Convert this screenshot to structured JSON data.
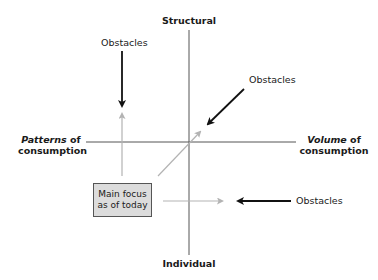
{
  "diagram": {
    "axes": {
      "top": "Structural",
      "bottom": "Individual",
      "left": {
        "italic": "Patterns",
        "rest": " of",
        "line2": "consumption"
      },
      "right": {
        "italic": "Volume",
        "rest": " of",
        "line2": "consumption"
      }
    },
    "focus_box": {
      "line1": "Main focus",
      "line2": "as of today"
    },
    "obstacles": [
      {
        "label": "Obstacles",
        "position": "upper-left"
      },
      {
        "label": "Obstacles",
        "position": "upper-right"
      },
      {
        "label": "Obstacles",
        "position": "lower-right"
      }
    ],
    "colors": {
      "axis": "#555555",
      "gray_arrow": "#b3b3b3",
      "black_arrow": "#111111",
      "box_fill": "#dcdcdc"
    }
  }
}
